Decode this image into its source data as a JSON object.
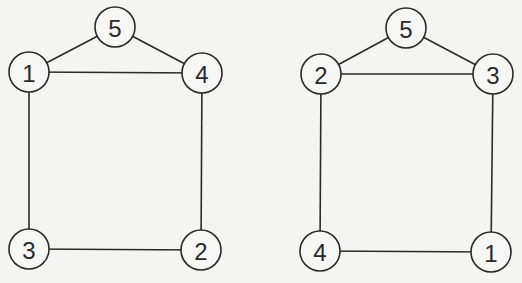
{
  "graphs": [
    {
      "name": "left-graph",
      "nodes": [
        {
          "id": "5",
          "label": "5",
          "x": 115,
          "y": 27
        },
        {
          "id": "1",
          "label": "1",
          "x": 29,
          "y": 72
        },
        {
          "id": "4",
          "label": "4",
          "x": 202,
          "y": 73
        },
        {
          "id": "3",
          "label": "3",
          "x": 29,
          "y": 249
        },
        {
          "id": "2",
          "label": "2",
          "x": 201,
          "y": 250
        }
      ],
      "edges": [
        [
          "5",
          "1"
        ],
        [
          "5",
          "4"
        ],
        [
          "1",
          "4"
        ],
        [
          "1",
          "3"
        ],
        [
          "4",
          "2"
        ],
        [
          "3",
          "2"
        ]
      ]
    },
    {
      "name": "right-graph",
      "nodes": [
        {
          "id": "5",
          "label": "5",
          "x": 406,
          "y": 28
        },
        {
          "id": "2",
          "label": "2",
          "x": 321,
          "y": 74
        },
        {
          "id": "3",
          "label": "3",
          "x": 493,
          "y": 74
        },
        {
          "id": "4",
          "label": "4",
          "x": 320,
          "y": 251
        },
        {
          "id": "1",
          "label": "1",
          "x": 491,
          "y": 252
        }
      ],
      "edges": [
        [
          "5",
          "2"
        ],
        [
          "5",
          "3"
        ],
        [
          "2",
          "3"
        ],
        [
          "2",
          "4"
        ],
        [
          "3",
          "1"
        ],
        [
          "4",
          "1"
        ]
      ]
    }
  ],
  "style": {
    "stroke": "#2a2a2a",
    "background": "#f4f4f2",
    "node_radius": 20
  }
}
